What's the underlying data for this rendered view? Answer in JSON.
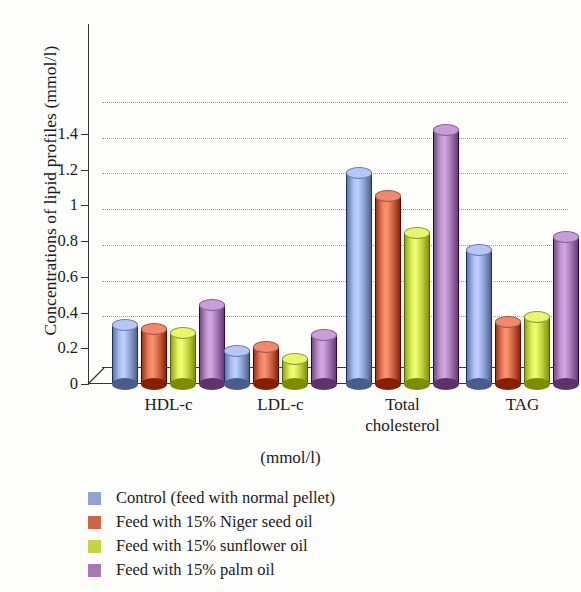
{
  "chart_data": {
    "type": "bar",
    "title": "",
    "xlabel": "(mmol/l)",
    "ylabel": "Concentrations of lipid profiles (mmol/l)",
    "categories": [
      "HDL-c",
      "LDL-c",
      "Total\ncholesterol",
      "TAG"
    ],
    "ylim": [
      0,
      1.4
    ],
    "ytick_labels": [
      "0",
      "0.2",
      "0.4",
      "0.6",
      "0.8",
      "1",
      "1.2",
      "1.4"
    ],
    "ytick_values": [
      0,
      0.2,
      0.4,
      0.6,
      0.8,
      1.0,
      1.2,
      1.4
    ],
    "grid": true,
    "grid_style": "dotted-horizontal",
    "legend_position": "bottom-left",
    "style": "3d-cylinder",
    "series": [
      {
        "name": "Control (feed with normal pellet)",
        "color": "#8fa4d4",
        "values": [
          0.33,
          0.185,
          1.18,
          0.75
        ]
      },
      {
        "name": "Feed with 15% Niger seed oil",
        "color": "#cf6445",
        "values": [
          0.31,
          0.205,
          1.055,
          0.35
        ]
      },
      {
        "name": "Feed with 15% sunflower oil",
        "color": "#c3d442",
        "values": [
          0.285,
          0.14,
          0.845,
          0.375
        ]
      },
      {
        "name": "Feed with 15% palm oil",
        "color": "#a57ab4",
        "values": [
          0.44,
          0.275,
          1.42,
          0.825
        ]
      }
    ]
  }
}
